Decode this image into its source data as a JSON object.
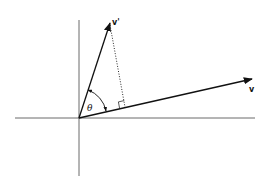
{
  "diagram": {
    "type": "vector-projection",
    "axes": {
      "origin": [
        79,
        118
      ],
      "x_axis": {
        "from": [
          15,
          118
        ],
        "to": [
          255,
          118
        ]
      },
      "y_axis": {
        "from": [
          79,
          20
        ],
        "to": [
          79,
          176
        ]
      }
    },
    "vectors": [
      {
        "name": "v-prime",
        "label": "v'",
        "from": [
          79,
          118
        ],
        "to": [
          110,
          23
        ]
      },
      {
        "name": "v",
        "label": "v",
        "from": [
          79,
          118
        ],
        "to": [
          252,
          79
        ]
      }
    ],
    "projection": {
      "from": [
        110,
        23
      ],
      "foot": [
        125,
        107
      ],
      "style": "dotted"
    },
    "angle": {
      "label": "θ"
    },
    "colors": {
      "stroke": "#111111",
      "axis": "#444444",
      "background": "#ffffff"
    }
  }
}
